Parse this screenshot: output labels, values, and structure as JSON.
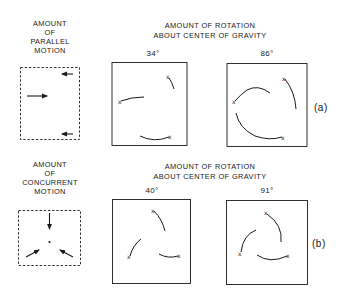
{
  "row_a": {
    "left_label": [
      "AMOUNT",
      "OF",
      "PARALLEL",
      "MOTION"
    ],
    "header": [
      "AMOUNT OF ROTATION",
      "ABOUT CENTER OF GRAVITY"
    ],
    "panels": [
      {
        "angle": "34°"
      },
      {
        "angle": "86°"
      }
    ],
    "tag": "(a)"
  },
  "row_b": {
    "left_label": [
      "AMOUNT",
      "OF",
      "CONCURRENT",
      "MOTION"
    ],
    "header": [
      "AMOUNT OF ROTATION",
      "ABOUT CENTER OF GRAVITY"
    ],
    "panels": [
      {
        "angle": "40°"
      },
      {
        "angle": "91°"
      }
    ],
    "tag": "(b)"
  },
  "colors": {
    "ink": "#1a1a1a",
    "background": "#ffffff"
  }
}
